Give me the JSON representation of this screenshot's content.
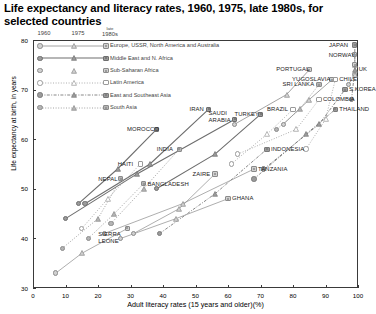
{
  "title": "Life expectancy and literacy rates, 1960, 1975, late 1980s, for selected countries",
  "axes": {
    "ylabel": "Life expectancy at birth, in years",
    "xlabel": "Adult literacy rates (15 years and older)(%)",
    "yticks": [
      "30",
      "40",
      "50",
      "60",
      "70",
      "80"
    ],
    "xticks": [
      "0",
      "10",
      "20",
      "30",
      "40",
      "50",
      "60",
      "70",
      "80",
      "90",
      "100"
    ]
  },
  "legend": {
    "headers": [
      "1960",
      "1975",
      "late 1980s"
    ],
    "items": [
      {
        "label": "Europe, USSR, North America and Australia",
        "fill": "open",
        "line": "solid-thin"
      },
      {
        "label": "Middle East and N. Africa",
        "fill": "filled",
        "line": "solid-thick"
      },
      {
        "label": "Sub-Saharan Africa",
        "fill": "open",
        "line": "none"
      },
      {
        "label": "Latin America",
        "fill": "white",
        "line": "dotted"
      },
      {
        "label": "East and Southeast Asia",
        "fill": "filled",
        "line": "dashdot"
      },
      {
        "label": "South Asia",
        "fill": "filled",
        "line": "dotted"
      }
    ]
  },
  "chart_data": {
    "type": "scatter",
    "title": "Life expectancy and literacy rates, 1960, 1975, late 1980s, for selected countries",
    "xlabel": "Adult literacy rates (15 years and older)(%)",
    "ylabel": "Life expectancy at birth, in years",
    "xlim": [
      0,
      100
    ],
    "ylim": [
      30,
      80
    ],
    "grid": false,
    "legend_position": "top-left-inside",
    "markers": {
      "1960": "circle",
      "1975": "triangle",
      "late1980s": "square"
    },
    "groups": [
      "Europe, USSR, North America and Australia",
      "Middle East and N. Africa",
      "Sub-Saharan Africa",
      "Latin America",
      "East and Southeast Asia",
      "South Asia"
    ],
    "series": [
      {
        "name": "JAPAN",
        "group": "East and Southeast Asia",
        "points": [
          {
            "year": "1960",
            "x": 98,
            "y": 68
          },
          {
            "year": "1975",
            "x": 99,
            "y": 74
          },
          {
            "year": "late1980s",
            "x": 99,
            "y": 79
          }
        ]
      },
      {
        "name": "NORWAY",
        "group": "Europe, USSR, North America and Australia",
        "points": [
          {
            "year": "1960",
            "x": 99,
            "y": 73
          },
          {
            "year": "1975",
            "x": 99,
            "y": 75
          },
          {
            "year": "late1980s",
            "x": 99,
            "y": 77
          }
        ]
      },
      {
        "name": "UK",
        "group": "Europe, USSR, North America and Australia",
        "points": [
          {
            "year": "1960",
            "x": 97,
            "y": 71
          },
          {
            "year": "1975",
            "x": 99,
            "y": 73
          },
          {
            "year": "late1980s",
            "x": 99,
            "y": 75
          }
        ]
      },
      {
        "name": "PORTUGAL",
        "group": "Europe, USSR, North America and Australia",
        "points": [
          {
            "year": "1960",
            "x": 62,
            "y": 63
          },
          {
            "year": "1975",
            "x": 78,
            "y": 69
          },
          {
            "year": "late1980s",
            "x": 85,
            "y": 74
          }
        ]
      },
      {
        "name": "YUGOSLAVIA",
        "group": "Europe, USSR, North America and Australia",
        "points": [
          {
            "year": "1960",
            "x": 77,
            "y": 63
          },
          {
            "year": "1975",
            "x": 85,
            "y": 68
          },
          {
            "year": "late1980s",
            "x": 92,
            "y": 72
          }
        ]
      },
      {
        "name": "SRI LANKA",
        "group": "South Asia",
        "points": [
          {
            "year": "1960",
            "x": 75,
            "y": 62
          },
          {
            "year": "1975",
            "x": 82,
            "y": 66
          },
          {
            "year": "late1980s",
            "x": 88,
            "y": 71
          }
        ]
      },
      {
        "name": "S.KOREA",
        "group": "East and Southeast Asia",
        "points": [
          {
            "year": "1960",
            "x": 71,
            "y": 54
          },
          {
            "year": "1975",
            "x": 88,
            "y": 63
          },
          {
            "year": "late1980s",
            "x": 96,
            "y": 70
          }
        ]
      },
      {
        "name": "THAILAND",
        "group": "East and Southeast Asia",
        "points": [
          {
            "year": "1960",
            "x": 68,
            "y": 52
          },
          {
            "year": "1975",
            "x": 84,
            "y": 61
          },
          {
            "year": "late1980s",
            "x": 93,
            "y": 66
          }
        ]
      },
      {
        "name": "COLOMBIA",
        "group": "Latin America",
        "points": [
          {
            "year": "1960",
            "x": 63,
            "y": 57
          },
          {
            "year": "1975",
            "x": 81,
            "y": 62
          },
          {
            "year": "late1980s",
            "x": 88,
            "y": 68
          }
        ]
      },
      {
        "name": "BRAZIL",
        "group": "Latin America",
        "points": [
          {
            "year": "1960",
            "x": 61,
            "y": 55
          },
          {
            "year": "1975",
            "x": 72,
            "y": 61
          },
          {
            "year": "late1980s",
            "x": 80,
            "y": 66
          }
        ]
      },
      {
        "name": "CHILE",
        "group": "Latin America",
        "points": [
          {
            "year": "1960",
            "x": 84,
            "y": 58
          },
          {
            "year": "1975",
            "x": 90,
            "y": 64
          },
          {
            "year": "late1980s",
            "x": 93,
            "y": 72
          }
        ]
      },
      {
        "name": "TURKEY",
        "group": "Middle East and N. Africa",
        "points": [
          {
            "year": "1960",
            "x": 38,
            "y": 50
          },
          {
            "year": "1975",
            "x": 56,
            "y": 57
          },
          {
            "year": "late1980s",
            "x": 70,
            "y": 65
          }
        ]
      },
      {
        "name": "SAUDI ARABIA",
        "group": "Middle East and N. Africa",
        "points": [
          {
            "year": "1960",
            "x": 10,
            "y": 44
          },
          {
            "year": "1975",
            "x": 32,
            "y": 53
          },
          {
            "year": "late1980s",
            "x": 62,
            "y": 64
          }
        ]
      },
      {
        "name": "IRAN",
        "group": "Middle East and N. Africa",
        "points": [
          {
            "year": "1960",
            "x": 16,
            "y": 47
          },
          {
            "year": "1975",
            "x": 36,
            "y": 55
          },
          {
            "year": "late1980s",
            "x": 54,
            "y": 66
          }
        ]
      },
      {
        "name": "MOROCCO",
        "group": "Middle East and N. Africa",
        "points": [
          {
            "year": "1960",
            "x": 14,
            "y": 47
          },
          {
            "year": "1975",
            "x": 26,
            "y": 54
          },
          {
            "year": "late1980s",
            "x": 38,
            "y": 62
          }
        ]
      },
      {
        "name": "INDONESIA",
        "group": "East and Southeast Asia",
        "points": [
          {
            "year": "1960",
            "x": 39,
            "y": 41
          },
          {
            "year": "1975",
            "x": 56,
            "y": 49
          },
          {
            "year": "late1980s",
            "x": 72,
            "y": 58
          }
        ]
      },
      {
        "name": "INDIA",
        "group": "South Asia",
        "points": [
          {
            "year": "1960",
            "x": 24,
            "y": 43
          },
          {
            "year": "1975",
            "x": 34,
            "y": 50
          },
          {
            "year": "late1980s",
            "x": 45,
            "y": 58
          }
        ]
      },
      {
        "name": "BANGLADESH",
        "group": "South Asia",
        "points": [
          {
            "year": "1960",
            "x": 17,
            "y": 40
          },
          {
            "year": "1975",
            "x": 25,
            "y": 45
          },
          {
            "year": "late1980s",
            "x": 34,
            "y": 51
          }
        ]
      },
      {
        "name": "NEPAL",
        "group": "South Asia",
        "points": [
          {
            "year": "1960",
            "x": 9,
            "y": 38
          },
          {
            "year": "1975",
            "x": 20,
            "y": 44
          },
          {
            "year": "late1980s",
            "x": 27,
            "y": 52
          }
        ]
      },
      {
        "name": "HAITI",
        "group": "Latin America",
        "points": [
          {
            "year": "1960",
            "x": 15,
            "y": 42
          },
          {
            "year": "1975",
            "x": 23,
            "y": 48
          },
          {
            "year": "late1980s",
            "x": 33,
            "y": 55
          }
        ]
      },
      {
        "name": "ZAIRE",
        "group": "Sub-Saharan Africa",
        "points": [
          {
            "year": "1960",
            "x": 31,
            "y": 41
          },
          {
            "year": "1975",
            "x": 45,
            "y": 46
          },
          {
            "year": "late1980s",
            "x": 56,
            "y": 53
          }
        ]
      },
      {
        "name": "TANZANIA",
        "group": "Sub-Saharan Africa",
        "points": [
          {
            "year": "1960",
            "x": 22,
            "y": 41
          },
          {
            "year": "1975",
            "x": 46,
            "y": 47
          },
          {
            "year": "late1980s",
            "x": 68,
            "y": 54
          }
        ]
      },
      {
        "name": "GHANA",
        "group": "Sub-Saharan Africa",
        "points": [
          {
            "year": "1960",
            "x": 27,
            "y": 40
          },
          {
            "year": "1975",
            "x": 44,
            "y": 44
          },
          {
            "year": "late1980s",
            "x": 60,
            "y": 48
          }
        ]
      },
      {
        "name": "SIERRA LEONE",
        "group": "Sub-Saharan Africa",
        "points": [
          {
            "year": "1960",
            "x": 7,
            "y": 33
          },
          {
            "year": "1975",
            "x": 15,
            "y": 37
          },
          {
            "year": "late1980s",
            "x": 29,
            "y": 42
          }
        ]
      }
    ],
    "annotations": [
      {
        "text": "JAPAN",
        "x": 98,
        "y": 79
      },
      {
        "text": "NORWAY",
        "x": 99,
        "y": 77
      },
      {
        "text": "UK",
        "x": 99,
        "y": 74
      },
      {
        "text": "PORTUGAL",
        "x": 85,
        "y": 74
      },
      {
        "text": "YUGOSLAVIA",
        "x": 92,
        "y": 72
      },
      {
        "text": "SRI LANKA",
        "x": 88,
        "y": 71
      },
      {
        "text": "S.KOREA",
        "x": 96,
        "y": 70
      },
      {
        "text": "THAILAND",
        "x": 93,
        "y": 66
      },
      {
        "text": "COLOMBIA",
        "x": 88,
        "y": 68
      },
      {
        "text": "BRAZIL",
        "x": 80,
        "y": 66
      },
      {
        "text": "CHILE",
        "x": 93,
        "y": 72
      },
      {
        "text": "TURKEY",
        "x": 70,
        "y": 65
      },
      {
        "text": "SAUDI ARABIA",
        "x": 62,
        "y": 64
      },
      {
        "text": "IRAN",
        "x": 54,
        "y": 66
      },
      {
        "text": "MOROCCO",
        "x": 38,
        "y": 62
      },
      {
        "text": "INDONESIA",
        "x": 72,
        "y": 58
      },
      {
        "text": "INDIA",
        "x": 45,
        "y": 58
      },
      {
        "text": "BANGLADESH",
        "x": 34,
        "y": 51
      },
      {
        "text": "NEPAL",
        "x": 27,
        "y": 52
      },
      {
        "text": "HAITI",
        "x": 33,
        "y": 55
      },
      {
        "text": "ZAIRE",
        "x": 56,
        "y": 53
      },
      {
        "text": "TANZANIA",
        "x": 68,
        "y": 54
      },
      {
        "text": "GHANA",
        "x": 60,
        "y": 48
      },
      {
        "text": "SIERRA LEONE",
        "x": 29,
        "y": 42
      }
    ]
  }
}
